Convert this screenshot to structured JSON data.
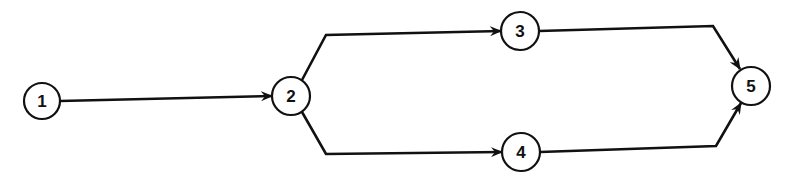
{
  "diagram": {
    "type": "directed-network",
    "colors": {
      "line": "#111111",
      "node_fill": "#ffffff",
      "background": "#ffffff"
    },
    "nodes": [
      {
        "id": "1",
        "label": "1",
        "cx": 42,
        "cy": 101,
        "r": 18
      },
      {
        "id": "2",
        "label": "2",
        "cx": 291,
        "cy": 96,
        "r": 19
      },
      {
        "id": "3",
        "label": "3",
        "cx": 520,
        "cy": 31,
        "r": 19
      },
      {
        "id": "4",
        "label": "4",
        "cx": 521,
        "cy": 152,
        "r": 19
      },
      {
        "id": "5",
        "label": "5",
        "cx": 751,
        "cy": 86,
        "r": 19
      }
    ],
    "edges": [
      {
        "from": "1",
        "to": "2",
        "points": "60,101 272,96"
      },
      {
        "from": "2",
        "to": "3",
        "points": "302,80 326,35 501,31"
      },
      {
        "from": "2",
        "to": "4",
        "points": "302,112 326,154 502,152"
      },
      {
        "from": "3",
        "to": "5",
        "points": "539,31 713,26 740,69"
      },
      {
        "from": "4",
        "to": "5",
        "points": "540,152 716,146 741,103"
      }
    ]
  }
}
